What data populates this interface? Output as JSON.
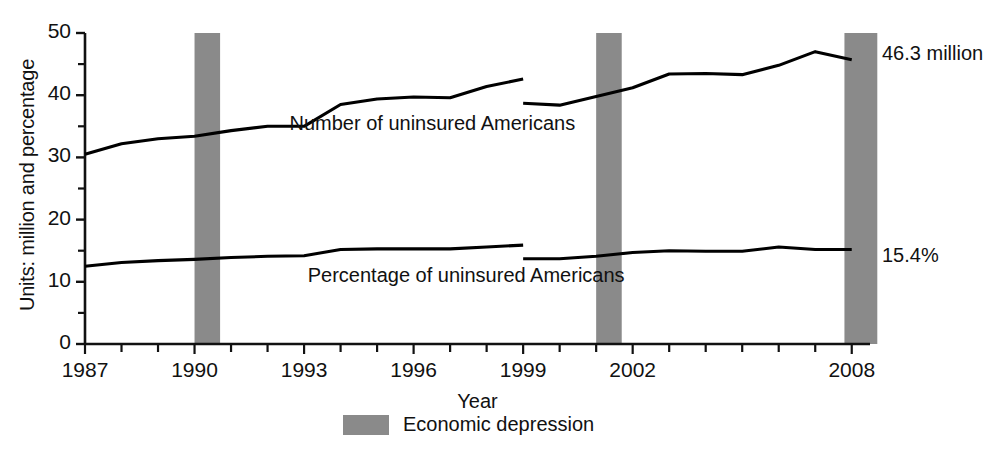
{
  "chart_data": {
    "type": "line",
    "title": "",
    "subtitle": "",
    "xlabel": "Year",
    "ylabel": "Units: million and percentage",
    "xlim": [
      1987,
      2008.5
    ],
    "ylim": [
      0,
      50
    ],
    "grid": false,
    "legend_position": "bottom-center",
    "y_ticks": [
      "50",
      "40",
      "30",
      "20",
      "10",
      "0"
    ],
    "y_tick_values": [
      50,
      40,
      30,
      20,
      10,
      0
    ],
    "y_minor_tick_values": [
      45,
      35,
      25,
      15,
      5
    ],
    "x_ticks": [
      "1987",
      "1990",
      "1993",
      "1996",
      "1999",
      "2002",
      "2008"
    ],
    "x_tick_values": [
      1987,
      1990,
      1993,
      1996,
      1999,
      2002,
      2008
    ],
    "x_all_tick_years": [
      1987,
      1988,
      1989,
      1990,
      1991,
      1992,
      1993,
      1994,
      1995,
      1996,
      1997,
      1998,
      1999,
      2000,
      2001,
      2002,
      2003,
      2004,
      2005,
      2006,
      2007,
      2008
    ],
    "series": [
      {
        "name": "Number of uninsured Americans",
        "units": "million",
        "color": "#000000",
        "label_x": 1992.6,
        "label_y": 35.2,
        "segments": [
          {
            "x": [
              1987,
              1988,
              1989,
              1990,
              1991,
              1992,
              1993,
              1994,
              1995,
              1996,
              1997,
              1998,
              1999
            ],
            "y": [
              30.5,
              32.2,
              33.0,
              33.4,
              34.3,
              35.0,
              35.0,
              38.5,
              39.4,
              39.7,
              39.6,
              41.4,
              42.6
            ]
          },
          {
            "x": [
              1999,
              2000,
              2001,
              2002,
              2003,
              2004,
              2005,
              2006,
              2007,
              2008
            ],
            "y": [
              38.7,
              38.4,
              39.8,
              41.2,
              43.4,
              43.5,
              43.3,
              44.8,
              47.0,
              45.7
            ]
          }
        ],
        "endpoint_label": "46.3 million",
        "endpoint_value": 46.3
      },
      {
        "name": "Percentage of uninsured Americans",
        "units": "percent",
        "color": "#000000",
        "label_x": 1993.1,
        "label_y": 10.7,
        "segments": [
          {
            "x": [
              1987,
              1988,
              1989,
              1990,
              1991,
              1992,
              1993,
              1994,
              1995,
              1996,
              1997,
              1998,
              1999
            ],
            "y": [
              12.5,
              13.1,
              13.4,
              13.6,
              13.9,
              14.1,
              14.2,
              15.2,
              15.3,
              15.3,
              15.3,
              15.6,
              15.9
            ]
          },
          {
            "x": [
              1999,
              2000,
              2001,
              2002,
              2003,
              2004,
              2005,
              2006,
              2007,
              2008
            ],
            "y": [
              13.7,
              13.7,
              14.1,
              14.7,
              15.0,
              14.9,
              14.9,
              15.6,
              15.2,
              15.2
            ]
          }
        ],
        "endpoint_label": "15.4%",
        "endpoint_value": 15.4
      }
    ],
    "shaded_bands": [
      {
        "label": "Economic depression",
        "start": 1990.0,
        "end": 1990.7,
        "color": "#8a8a8a"
      },
      {
        "label": "Economic depression",
        "start": 2001.0,
        "end": 2001.7,
        "color": "#8a8a8a"
      },
      {
        "label": "Economic depression",
        "start": 2007.8,
        "end": 2008.7,
        "color": "#8a8a8a"
      }
    ],
    "legend": [
      {
        "label": "Economic depression",
        "swatch_color": "#8a8a8a",
        "type": "band"
      }
    ]
  },
  "colors": {
    "band": "#8a8a8a",
    "line": "#000000",
    "axis": "#111111",
    "background": "#ffffff"
  }
}
